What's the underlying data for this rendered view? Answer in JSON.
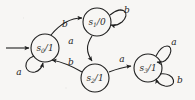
{
  "figure": {
    "type": "state-transition-diagram",
    "background_color": "#f7f6f4",
    "stroke_color": "#1f1f1f",
    "width": 195,
    "height": 100
  },
  "states": [
    {
      "id": "s0",
      "name": "s",
      "subscript": "0",
      "separator": "/",
      "output": "1",
      "label": "s0/1",
      "cx": 45,
      "cy": 48,
      "r": 14,
      "is_start": true
    },
    {
      "id": "s1",
      "name": "s",
      "subscript": "1",
      "separator": "/",
      "output": "0",
      "label": "s1/0",
      "cx": 97,
      "cy": 22,
      "r": 14,
      "is_start": false
    },
    {
      "id": "s2",
      "name": "s",
      "subscript": "2",
      "separator": "/",
      "output": "1",
      "label": "s2/1",
      "cx": 95,
      "cy": 78,
      "r": 14,
      "is_start": false
    },
    {
      "id": "s3",
      "name": "s",
      "subscript": "3",
      "separator": "/",
      "output": "1",
      "label": "s3/1",
      "cx": 148,
      "cy": 68,
      "r": 14,
      "is_start": false
    }
  ],
  "start_arrow": {
    "label": "",
    "from_x": 6,
    "from_y": 48,
    "to_x": 30,
    "to_y": 48
  },
  "transitions": [
    {
      "id": "s0-to-s1",
      "from": "s0",
      "to": "s1",
      "input": "b",
      "label_x": 65,
      "label_y": 24,
      "kind": "curve"
    },
    {
      "id": "s1-self",
      "from": "s1",
      "to": "s1",
      "input": "b",
      "label_x": 127,
      "label_y": 10,
      "kind": "self-loop"
    },
    {
      "id": "s1-to-s2",
      "from": "s1",
      "to": "s2",
      "input": "a",
      "label_x": 71,
      "label_y": 41,
      "kind": "curve"
    },
    {
      "id": "s0-self",
      "from": "s0",
      "to": "s0",
      "input": "a",
      "label_x": 19,
      "label_y": 72,
      "kind": "self-loop"
    },
    {
      "id": "s2-to-s0",
      "from": "s2",
      "to": "s0",
      "input": "b",
      "label_x": 71,
      "label_y": 62,
      "kind": "curve"
    },
    {
      "id": "s2-to-s3",
      "from": "s2",
      "to": "s3",
      "input": "a",
      "label_x": 122,
      "label_y": 59,
      "kind": "line"
    },
    {
      "id": "s3-self-upper",
      "from": "s3",
      "to": "s3",
      "input": "a",
      "label_x": 174,
      "label_y": 42,
      "kind": "self-loop"
    },
    {
      "id": "s3-self-lower",
      "from": "s3",
      "to": "s3",
      "input": "b",
      "label_x": 180,
      "label_y": 80,
      "kind": "self-loop"
    }
  ]
}
